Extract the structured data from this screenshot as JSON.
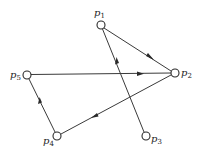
{
  "diagram": {
    "type": "directed-graph",
    "nodes": [
      {
        "id": "p1",
        "label": "p",
        "sub": "1",
        "x": 101,
        "y": 25,
        "lx": 93,
        "ly": 15
      },
      {
        "id": "p2",
        "label": "p",
        "sub": "2",
        "x": 175,
        "y": 73,
        "lx": 182,
        "ly": 77
      },
      {
        "id": "p3",
        "label": "p",
        "sub": "3",
        "x": 146,
        "y": 136,
        "lx": 152,
        "ly": 143
      },
      {
        "id": "p4",
        "label": "p",
        "sub": "4",
        "x": 57,
        "y": 136,
        "lx": 40,
        "ly": 144
      },
      {
        "id": "p5",
        "label": "p",
        "sub": "5",
        "x": 27,
        "y": 75,
        "lx": 8,
        "ly": 79
      }
    ],
    "edges": [
      {
        "from": "p1",
        "to": "p2"
      },
      {
        "from": "p5",
        "to": "p2"
      },
      {
        "from": "p2",
        "to": "p4"
      },
      {
        "from": "p4",
        "to": "p5"
      },
      {
        "from": "p3",
        "to": "p1"
      }
    ],
    "colors": {
      "stroke": "#2a2a2a",
      "background": "#ffffff"
    }
  }
}
